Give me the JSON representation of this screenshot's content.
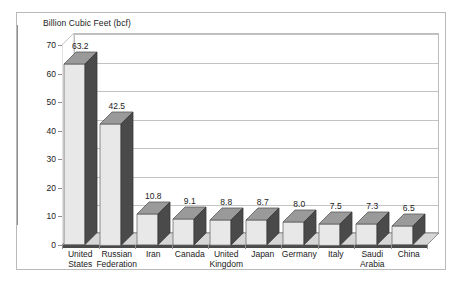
{
  "chart_data": {
    "type": "bar",
    "title": "Billion Cubic Feet (bcf)",
    "xlabel": "",
    "ylabel": "Billion Cubic Feet (bcf)",
    "ylim": [
      0,
      70
    ],
    "ytick_values": [
      0,
      10,
      20,
      30,
      40,
      50,
      60,
      70
    ],
    "ytick_labels": [
      "0",
      "10",
      "20",
      "30",
      "40",
      "50",
      "60",
      "70"
    ],
    "grid": true,
    "legend": "none",
    "style": "3d-column",
    "categories": [
      "United States",
      "Russian Federation",
      "Iran",
      "Canada",
      "United Kingdom",
      "Japan",
      "Germany",
      "Italy",
      "Saudi Arabia",
      "China"
    ],
    "values": [
      63.2,
      42.5,
      10.8,
      9.1,
      8.8,
      8.7,
      8.0,
      7.5,
      7.3,
      6.5
    ],
    "value_labels": [
      "63.2",
      "42.5",
      "10.8",
      "9.1",
      "8.8",
      "8.7",
      "8.0",
      "7.5",
      "7.3",
      "6.5"
    ]
  },
  "colors": {
    "bar_front": "#e8e8e8",
    "bar_side": "#4a4a4a",
    "bar_top": "#9a9a9a",
    "gridline": "#c3c3c3",
    "axis": "#8f8f8f",
    "frame_border": "#b9b9b9",
    "text": "#1b1b1b",
    "floor": "#d6d6d6",
    "floor_edge": "#4a4a4a"
  }
}
